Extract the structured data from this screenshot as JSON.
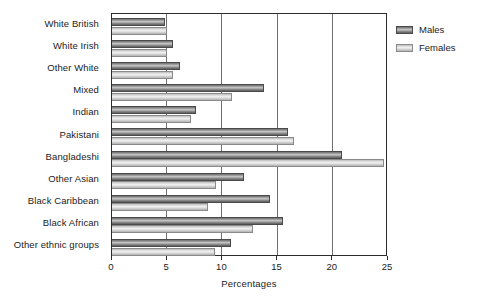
{
  "chart_data": {
    "type": "bar",
    "orientation": "horizontal",
    "title": "",
    "xlabel": "Percentages",
    "ylabel": "",
    "xlim": [
      0,
      25
    ],
    "xticks": [
      0,
      5,
      10,
      15,
      20,
      25
    ],
    "xtick_labels": [
      "0",
      "5",
      "10",
      "15",
      "20",
      "25"
    ],
    "grid": "vertical",
    "legend_position": "top-right",
    "categories": [
      "White British",
      "White Irish",
      "Other White",
      "Mixed",
      "Indian",
      "Pakistani",
      "Bangladeshi",
      "Other Asian",
      "Black Caribbean",
      "Black African",
      "Other ethnic groups"
    ],
    "series": [
      {
        "name": "Males",
        "color": "#8e8e8e",
        "values": [
          4.8,
          5.5,
          6.2,
          13.8,
          7.6,
          15.9,
          20.8,
          12.0,
          14.3,
          15.5,
          10.8
        ]
      },
      {
        "name": "Females",
        "color": "#d8d8d8",
        "values": [
          5.0,
          5.0,
          5.5,
          10.9,
          7.2,
          16.5,
          24.6,
          9.4,
          8.7,
          12.8,
          9.3
        ]
      }
    ]
  },
  "legend": {
    "items": [
      {
        "label": "Males"
      },
      {
        "label": "Females"
      }
    ]
  }
}
